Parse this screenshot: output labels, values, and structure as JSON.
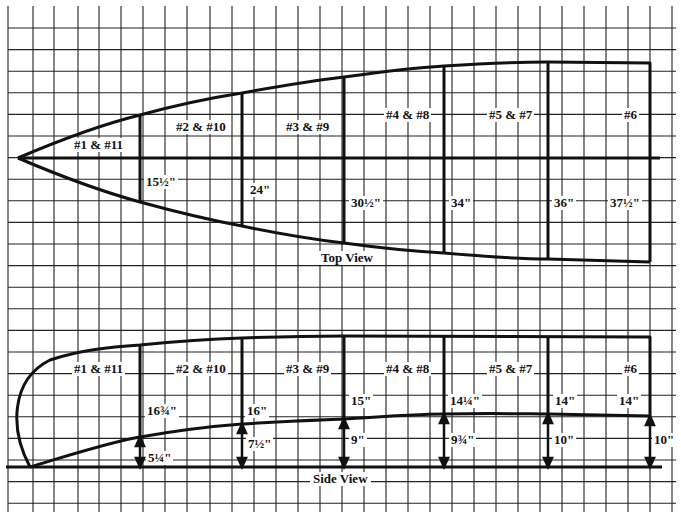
{
  "diagram": {
    "top_view": {
      "title": "Top View",
      "stations": [
        {
          "label": "#1 & #11",
          "width": "15½\""
        },
        {
          "label": "#2 & #10",
          "width": "24\""
        },
        {
          "label": "#3 & #9",
          "width": "30½\""
        },
        {
          "label": "#4 & #8",
          "width": "34\""
        },
        {
          "label": "#5 & #7",
          "width": "36\""
        },
        {
          "label": "#6",
          "width": "37½\""
        }
      ]
    },
    "side_view": {
      "title": "Side View",
      "stations": [
        {
          "label": "#1 & #11",
          "side_height": "16¾\"",
          "bottom_height": "5¼\""
        },
        {
          "label": "#2 & #10",
          "side_height": "16\"",
          "bottom_height": "7½\""
        },
        {
          "label": "#3 & #9",
          "side_height": "15\"",
          "bottom_height": "9\""
        },
        {
          "label": "#4 & #8",
          "side_height": "14¼\"",
          "bottom_height": "9¾\""
        },
        {
          "label": "#5 & #7",
          "side_height": "14\"",
          "bottom_height": "10\""
        },
        {
          "label": "#6",
          "side_height": "14\"",
          "bottom_height": "10\""
        }
      ]
    },
    "colors": {
      "line": "#111111",
      "grid": "#222222",
      "background": "#ffffff"
    }
  }
}
